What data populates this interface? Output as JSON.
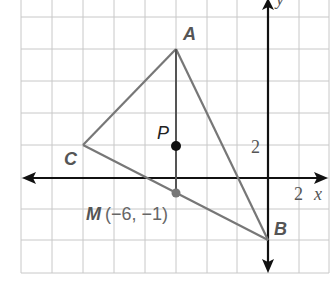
{
  "diagram": {
    "type": "coordinate-plane triangle",
    "grid": {
      "units_per_square": 2,
      "color": "#c8c8c8"
    },
    "axes": {
      "x_label": "x",
      "y_label": "y",
      "x_tick_label": "2",
      "y_tick_label": "2",
      "color": "#111111"
    },
    "points": {
      "A": {
        "label": "A",
        "x": -6,
        "y": 8
      },
      "B": {
        "label": "B",
        "x": 0,
        "y": -4
      },
      "C": {
        "label": "C",
        "x": -12,
        "y": 2
      },
      "P": {
        "label": "P",
        "x": -6,
        "y": 2
      },
      "M": {
        "label": "M",
        "coord_text": "(−6, −1)",
        "x": -6,
        "y": -1
      }
    },
    "segments": [
      "AB",
      "BC",
      "CA",
      "AM"
    ],
    "colors": {
      "triangle": "#777777",
      "point_P": "#111111",
      "point_M": "#777777"
    }
  }
}
